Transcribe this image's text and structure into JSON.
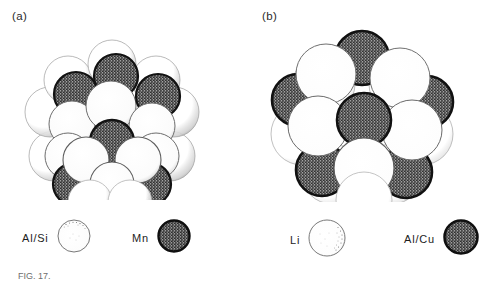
{
  "figure": {
    "caption_partial": "FIG. 17.",
    "panels": [
      {
        "id": "a",
        "label": "(a)",
        "cluster_name": "Al/Si-Mn icosahedral cluster",
        "legend": [
          {
            "label": "Al/Si",
            "swatch": "light-sphere"
          },
          {
            "label": "Mn",
            "swatch": "dark-sphere"
          }
        ]
      },
      {
        "id": "b",
        "label": "(b)",
        "cluster_name": "Li-Al/Cu icosahedral cluster",
        "legend": [
          {
            "label": "Li",
            "swatch": "light-sphere"
          },
          {
            "label": "Al/Cu",
            "swatch": "dark-sphere"
          }
        ]
      }
    ]
  },
  "colors": {
    "background": "#ffffff",
    "ink": "#1a1a1a",
    "light_sphere_fill": "#ffffff",
    "light_sphere_stroke": "#4a4a4a",
    "dark_sphere_stroke": "#111111",
    "dark_sphere_stipple": "#2a2a2a",
    "caption_text": "#6e6e6e"
  }
}
